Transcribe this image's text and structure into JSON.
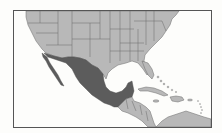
{
  "map": {
    "highlighted_country": "Mexico",
    "colors": {
      "water": "#fdfdfb",
      "land": "#b8b8b8",
      "highlight": "#5c5c5c",
      "border": "#6a6a6a",
      "frame": "#555555"
    },
    "regions": [
      {
        "name": "United States",
        "style": "land"
      },
      {
        "name": "Mexico",
        "style": "highlight"
      },
      {
        "name": "Central America",
        "style": "land"
      },
      {
        "name": "Cuba",
        "style": "land"
      },
      {
        "name": "Hispaniola",
        "style": "land"
      },
      {
        "name": "Jamaica",
        "style": "land"
      },
      {
        "name": "Puerto Rico",
        "style": "land"
      },
      {
        "name": "Bahamas",
        "style": "land"
      },
      {
        "name": "Lesser Antilles",
        "style": "land"
      },
      {
        "name": "South America (north coast)",
        "style": "land"
      }
    ]
  }
}
